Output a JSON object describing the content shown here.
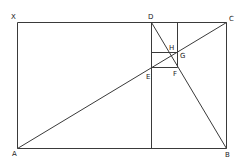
{
  "diagram": {
    "type": "geometric-construction",
    "points": {
      "X": {
        "label": "X"
      },
      "A": {
        "label": "A"
      },
      "B": {
        "label": "B"
      },
      "C": {
        "label": "C"
      },
      "D": {
        "label": "D"
      },
      "E": {
        "label": "E"
      },
      "F": {
        "label": "F"
      },
      "G": {
        "label": "G"
      },
      "H": {
        "label": "H"
      }
    },
    "segments": [
      {
        "name": "XC",
        "from": "X",
        "to": "C"
      },
      {
        "name": "XA",
        "from": "X",
        "to": "A"
      },
      {
        "name": "AB",
        "from": "A",
        "to": "B"
      },
      {
        "name": "CB",
        "from": "C",
        "to": "B"
      },
      {
        "name": "D-bottom",
        "from": "D",
        "to": "D_bottom"
      },
      {
        "name": "inner-vertical",
        "from": "K",
        "to": "F"
      },
      {
        "name": "EF",
        "from": "E",
        "to": "F"
      },
      {
        "name": "H-line",
        "from": "L",
        "to": "G"
      },
      {
        "name": "AC",
        "from": "A",
        "to": "C"
      },
      {
        "name": "DB",
        "from": "D",
        "to": "B"
      }
    ],
    "line_color": "#3a3a3a"
  }
}
